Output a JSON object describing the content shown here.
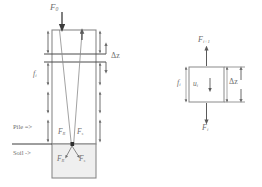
{
  "figure": {
    "type": "engineering-diagram",
    "background_color": "#ffffff",
    "line_color": "#6f6f6f",
    "dark_line_color": "#4a4a4a",
    "soil_fill_color": "#efefef",
    "label_color": "#6f6f6f"
  },
  "left_diagram": {
    "name": "pile-soil-system",
    "top_force": {
      "symbol": "F",
      "subscript": "0"
    },
    "shaft_friction": {
      "symbol": "f",
      "subscript": "i"
    },
    "segment_height": {
      "symbol": "Δz"
    },
    "pile_note": "Pile =>",
    "soil_note": "Soil ->",
    "tip_forces": [
      {
        "symbol": "F",
        "subscript": "R",
        "position": "pile-left"
      },
      {
        "symbol": "F",
        "subscript": "s",
        "position": "pile-right"
      },
      {
        "symbol": "F",
        "subscript": "R",
        "position": "soil-left"
      },
      {
        "symbol": "F",
        "subscript": "s",
        "position": "soil-right"
      }
    ],
    "side_arrow_count": 4
  },
  "right_diagram": {
    "name": "element-free-body",
    "top_force": {
      "symbol": "F",
      "subscript": "i+1"
    },
    "bottom_force": {
      "symbol": "F",
      "subscript": "i"
    },
    "side_friction": {
      "symbol": "f",
      "subscript": "i"
    },
    "displacement": {
      "symbol": "u",
      "subscript": "i"
    },
    "element_height": {
      "symbol": "Δz"
    }
  }
}
